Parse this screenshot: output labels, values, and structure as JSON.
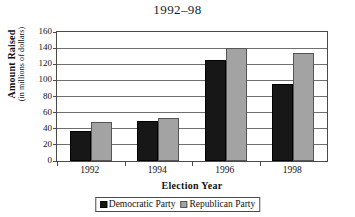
{
  "chart_data": {
    "type": "bar",
    "title": "1992–98",
    "xlabel": "Election Year",
    "ylabel": "Amount Raised",
    "ylabel_sub": "(in millions of dollars)",
    "categories": [
      "1992",
      "1994",
      "1996",
      "1998"
    ],
    "series": [
      {
        "name": "Democratic Party",
        "color": "#171717",
        "values": [
          37,
          50,
          125,
          96
        ]
      },
      {
        "name": "Republican Party",
        "color": "#a3a3a3",
        "values": [
          49,
          53,
          140,
          134
        ]
      }
    ],
    "ylim": [
      0,
      160
    ],
    "ytick_step": 20,
    "yticks": [
      0,
      20,
      40,
      60,
      80,
      100,
      120,
      140,
      160
    ],
    "grid": true,
    "legend_position": "bottom"
  },
  "legend": {
    "entries": [
      {
        "label": "Democratic Party",
        "swatch": "black-square-swatch"
      },
      {
        "label": "Republican Party",
        "swatch": "gray-square-swatch"
      }
    ]
  }
}
